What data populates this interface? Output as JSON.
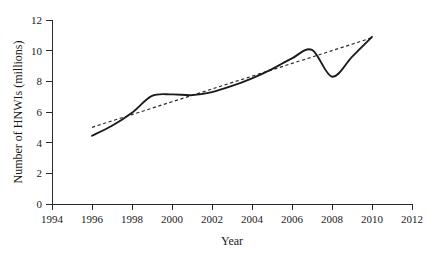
{
  "chart_data": {
    "type": "line",
    "title": "",
    "xlabel": "Year",
    "ylabel": "Number of HNWIs (millions)",
    "xlim": [
      1994,
      2012
    ],
    "ylim": [
      0,
      12
    ],
    "xticks": [
      1994,
      1996,
      1998,
      2000,
      2002,
      2004,
      2006,
      2008,
      2010,
      2012
    ],
    "yticks": [
      0,
      2,
      4,
      6,
      8,
      10,
      12
    ],
    "xtick_labels": [
      "1994",
      "1996",
      "1998",
      "2000",
      "2002",
      "2004",
      "2006",
      "2008",
      "2010",
      "2012"
    ],
    "ytick_labels": [
      "0",
      "2",
      "4",
      "6",
      "8",
      "10",
      "12"
    ],
    "grid": false,
    "legend": "none",
    "x": [
      1996,
      1997,
      1998,
      1999,
      2000,
      2001,
      2002,
      2003,
      2004,
      2005,
      2006,
      2007,
      2008,
      2009,
      2010
    ],
    "series": [
      {
        "name": "Number of HNWIs",
        "style": "solid",
        "color": "#1b1b1b",
        "values": [
          4.45,
          5.1,
          5.95,
          7.05,
          7.15,
          7.1,
          7.3,
          7.7,
          8.2,
          8.8,
          9.5,
          10.05,
          8.3,
          9.6,
          10.9
        ]
      },
      {
        "name": "Linear trend",
        "style": "dashed",
        "color": "#2b2b2b",
        "values": [
          5.0,
          5.42,
          5.83,
          6.25,
          6.67,
          7.08,
          7.5,
          7.92,
          8.33,
          8.75,
          9.17,
          9.58,
          10.0,
          10.42,
          10.85
        ]
      }
    ]
  },
  "axes": {
    "x_axis_label": "Year",
    "y_axis_label": "Number of HNWIs (millions)"
  }
}
